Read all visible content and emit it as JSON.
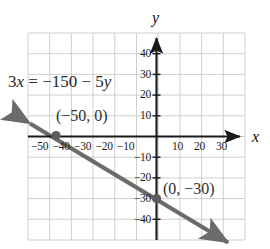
{
  "figure": {
    "kind": "coordinate-graph",
    "equation": {
      "prefix": "3",
      "var1": "x",
      "middle": " = −150 − 5",
      "var2": "y",
      "full": "3x = −150 − 5y"
    },
    "axis_labels": {
      "x": "x",
      "y": "y"
    },
    "point_labels": [
      {
        "text": "(−50, 0)",
        "name": "x-intercept-label"
      },
      {
        "text": "(0, −30)",
        "name": "y-intercept-label"
      }
    ],
    "colors": {
      "line": "#6b6b6b",
      "axis": "#1a1a1a",
      "grid": "#c9c9c9",
      "text": "#1c1c1c",
      "background": "#ffffff"
    }
  },
  "chart_data": {
    "type": "line",
    "title": "",
    "subtitle": "",
    "xlabel": "x",
    "ylabel": "y",
    "grid": true,
    "legend": null,
    "xlim": [
      -60,
      40
    ],
    "ylim": [
      -50,
      50
    ],
    "xticks": [
      -50,
      -40,
      -30,
      -20,
      -10,
      10,
      20,
      30
    ],
    "yticks": [
      40,
      30,
      20,
      10,
      -10,
      -20,
      -30,
      -40
    ],
    "xtick_labels": [
      "−50",
      "−40",
      "−30",
      "−20",
      "−10",
      "10",
      "20",
      "30"
    ],
    "ytick_labels": [
      "40",
      "30",
      "20",
      "10",
      "−10",
      "−20",
      "−30",
      "−40"
    ],
    "grid_step_x": 10,
    "grid_step_y": 10,
    "series": [
      {
        "name": "3x = −150 − 5y",
        "equation": "3x = -150 - 5y",
        "slope": -0.6,
        "intercept": -30,
        "x": [
          -60,
          40
        ],
        "y": [
          6,
          -54
        ],
        "arrows": [
          "start",
          "end"
        ]
      }
    ],
    "annotations": [
      {
        "text": "3x = −150 − 5y",
        "x": -48,
        "y": 23
      },
      {
        "text": "(−50, 0)",
        "x": -39,
        "y": 12
      },
      {
        "text": "(0, −30)",
        "x": 5,
        "y": -26
      }
    ],
    "points": [
      {
        "x": -50,
        "y": 0,
        "label": "(−50, 0)"
      },
      {
        "x": 0,
        "y": -30,
        "label": "(0, −30)"
      }
    ]
  }
}
